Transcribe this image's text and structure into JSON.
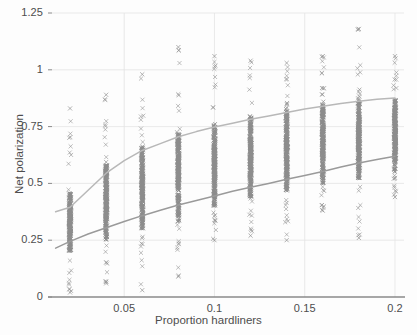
{
  "chart": {
    "type": "scatter",
    "title": "",
    "xlabel": "Proportion hardliners",
    "ylabel": "Net polarization",
    "background_color": "#fdfdfd",
    "grid_color": "#e3e3e3",
    "axis_color": "#8a8a8a",
    "marker_color": "#8c8c8c",
    "marker_symbol": "x",
    "upper_curve_color": "#b8b8b8",
    "lower_curve_color": "#9a9a9a"
  },
  "chart_data": {
    "type": "scatter",
    "title": "",
    "xlabel": "Proportion hardliners",
    "ylabel": "Net polarization",
    "xlim": [
      0.01,
      0.205
    ],
    "ylim": [
      0,
      1.25
    ],
    "grid": true,
    "legend": "none",
    "xticks": [
      "0.05",
      "0.1",
      "0.15",
      "0.2"
    ],
    "xtick_values": [
      0.05,
      0.1,
      0.15,
      0.2
    ],
    "yticks": [
      "0",
      "0.25",
      "0.5",
      "0.75",
      "1",
      "1.25"
    ],
    "ytick_values": [
      0,
      0.25,
      0.5,
      0.75,
      1,
      1.25
    ],
    "x_categories": [
      0.02,
      0.04,
      0.06,
      0.08,
      0.1,
      0.12,
      0.14,
      0.16,
      0.18,
      0.2
    ],
    "scatter_columns": [
      {
        "x": 0.02,
        "n": 120,
        "min": 0.02,
        "q1": 0.2,
        "median": 0.29,
        "q3": 0.46,
        "max": 0.83,
        "dense_low": 0.14,
        "dense_high": 0.52
      },
      {
        "x": 0.04,
        "n": 120,
        "min": 0.06,
        "q1": 0.25,
        "median": 0.4,
        "q3": 0.58,
        "max": 0.89,
        "dense_low": 0.17,
        "dense_high": 0.72
      },
      {
        "x": 0.06,
        "n": 120,
        "min": 0.03,
        "q1": 0.3,
        "median": 0.47,
        "q3": 0.66,
        "max": 0.98,
        "dense_low": 0.18,
        "dense_high": 0.8
      },
      {
        "x": 0.08,
        "n": 130,
        "min": 0.09,
        "q1": 0.33,
        "median": 0.53,
        "q3": 0.72,
        "max": 1.1,
        "dense_low": 0.22,
        "dense_high": 0.88
      },
      {
        "x": 0.1,
        "n": 130,
        "min": 0.25,
        "q1": 0.4,
        "median": 0.58,
        "q3": 0.76,
        "max": 1.06,
        "dense_low": 0.26,
        "dense_high": 0.92
      },
      {
        "x": 0.12,
        "n": 130,
        "min": 0.27,
        "q1": 0.44,
        "median": 0.62,
        "q3": 0.79,
        "max": 1.04,
        "dense_low": 0.29,
        "dense_high": 0.95
      },
      {
        "x": 0.14,
        "n": 130,
        "min": 0.25,
        "q1": 0.47,
        "median": 0.65,
        "q3": 0.82,
        "max": 1.03,
        "dense_low": 0.33,
        "dense_high": 0.96
      },
      {
        "x": 0.16,
        "n": 130,
        "min": 0.38,
        "q1": 0.5,
        "median": 0.68,
        "q3": 0.85,
        "max": 1.06,
        "dense_low": 0.4,
        "dense_high": 1.0
      },
      {
        "x": 0.18,
        "n": 130,
        "min": 0.26,
        "q1": 0.52,
        "median": 0.7,
        "q3": 0.86,
        "max": 1.18,
        "dense_low": 0.4,
        "dense_high": 1.03
      },
      {
        "x": 0.2,
        "n": 130,
        "min": 0.44,
        "q1": 0.55,
        "median": 0.72,
        "q3": 0.87,
        "max": 1.06,
        "dense_low": 0.45,
        "dense_high": 1.02
      }
    ],
    "series": [
      {
        "name": "upper-trend",
        "type": "line",
        "color": "#b8b8b8",
        "x": [
          0.012,
          0.02,
          0.03,
          0.04,
          0.05,
          0.06,
          0.07,
          0.08,
          0.09,
          0.1,
          0.11,
          0.12,
          0.13,
          0.14,
          0.15,
          0.16,
          0.17,
          0.18,
          0.19,
          0.2
        ],
        "values": [
          0.375,
          0.395,
          0.47,
          0.545,
          0.6,
          0.645,
          0.675,
          0.705,
          0.728,
          0.748,
          0.765,
          0.782,
          0.797,
          0.812,
          0.827,
          0.84,
          0.852,
          0.862,
          0.87,
          0.876
        ]
      },
      {
        "name": "lower-trend",
        "type": "line",
        "color": "#9a9a9a",
        "x": [
          0.012,
          0.02,
          0.03,
          0.04,
          0.05,
          0.06,
          0.07,
          0.08,
          0.09,
          0.1,
          0.11,
          0.12,
          0.13,
          0.14,
          0.15,
          0.16,
          0.17,
          0.18,
          0.19,
          0.2
        ],
        "values": [
          0.215,
          0.245,
          0.277,
          0.305,
          0.332,
          0.358,
          0.382,
          0.405,
          0.425,
          0.445,
          0.465,
          0.483,
          0.5,
          0.518,
          0.535,
          0.552,
          0.572,
          0.59,
          0.605,
          0.62
        ]
      }
    ]
  }
}
